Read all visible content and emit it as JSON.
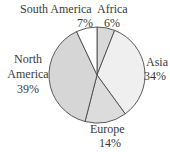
{
  "chart_data": {
    "type": "pie",
    "title": "",
    "categories": [
      "Africa",
      "Asia",
      "Europe",
      "North America",
      "South America"
    ],
    "values": [
      6,
      34,
      14,
      39,
      7
    ],
    "value_labels": [
      "6%",
      "34%",
      "14%",
      "39%",
      "7%"
    ],
    "colors": [
      "#d9d9d9",
      "#efefef",
      "#dcdcdc",
      "#d6d6d6",
      "#ffffff"
    ],
    "start_angle": "12 o'clock",
    "direction": "clockwise",
    "legend": "none (direct labels)"
  },
  "labels": {
    "africa": {
      "name": "Africa",
      "pct": "6%"
    },
    "asia": {
      "name": "Asia",
      "pct": "34%"
    },
    "europe": {
      "name": "Europe",
      "pct": "14%"
    },
    "north_america": {
      "name1": "North",
      "name2": "America",
      "pct": "39%"
    },
    "south_america": {
      "name": "South America",
      "pct": "7%"
    }
  }
}
